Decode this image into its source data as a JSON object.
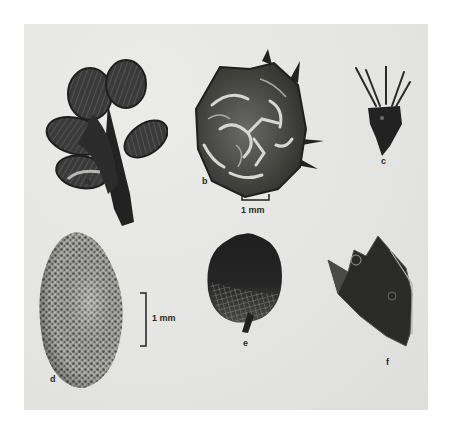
{
  "figure": {
    "background_color": "#ffffff",
    "plate_color": "#e6e6e4",
    "specimens": [
      {
        "id": "a",
        "label": "a",
        "description": "dark branched calyx / leafy shoot with ribbed lobes"
      },
      {
        "id": "b",
        "label": "b",
        "description": "rounded spiny fruit with reticulate surface"
      },
      {
        "id": "c",
        "label": "c",
        "description": "small dark fruit with long awns"
      },
      {
        "id": "d",
        "label": "d",
        "description": "speckled ovoid seed"
      },
      {
        "id": "e",
        "label": "e",
        "description": "dark veined round leaf with short petiole"
      },
      {
        "id": "f",
        "label": "f",
        "description": "dark angular translucent-edged fragment"
      }
    ],
    "scale_bars": [
      {
        "id": "scale-top",
        "orientation": "horizontal",
        "label": "1 mm"
      },
      {
        "id": "scale-left",
        "orientation": "vertical",
        "label": "1 mm"
      }
    ]
  }
}
